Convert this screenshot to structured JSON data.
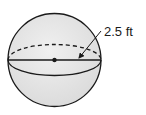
{
  "diagram": {
    "shape": "sphere",
    "radius_label": "2.5 ft",
    "colors": {
      "fill": "#e4e4e4",
      "stroke": "#1a1a1a"
    }
  }
}
